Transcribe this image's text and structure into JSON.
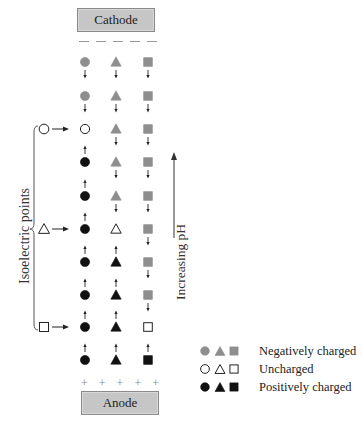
{
  "electrodes": {
    "cathode": "Cathode",
    "anode": "Anode",
    "cathode_sign": "−",
    "anode_sign": "+"
  },
  "labels": {
    "isoelectric": "Isoelectric points",
    "ph_axis": "Increasing pH"
  },
  "colors": {
    "negative": "#8e8e8e",
    "uncharged": "#ffffff",
    "positive": "#111111",
    "box": "#c6c6c6"
  },
  "columns": [
    "circle",
    "triangle",
    "square"
  ],
  "rows": [
    {
      "circle": {
        "state": "neg",
        "arrow": "down"
      },
      "triangle": {
        "state": "neg",
        "arrow": "down"
      },
      "square": {
        "state": "neg",
        "arrow": "down"
      }
    },
    {
      "circle": {
        "state": "neg",
        "arrow": "down"
      },
      "triangle": {
        "state": "neg",
        "arrow": "down"
      },
      "square": {
        "state": "neg",
        "arrow": "down"
      }
    },
    {
      "circle": {
        "state": "neutral",
        "arrow": "none"
      },
      "triangle": {
        "state": "neg",
        "arrow": "down"
      },
      "square": {
        "state": "neg",
        "arrow": "down"
      }
    },
    {
      "circle": {
        "state": "pos",
        "arrow": "up"
      },
      "triangle": {
        "state": "neg",
        "arrow": "down"
      },
      "square": {
        "state": "neg",
        "arrow": "down"
      }
    },
    {
      "circle": {
        "state": "pos",
        "arrow": "up"
      },
      "triangle": {
        "state": "neg",
        "arrow": "down"
      },
      "square": {
        "state": "neg",
        "arrow": "down"
      }
    },
    {
      "circle": {
        "state": "pos",
        "arrow": "up"
      },
      "triangle": {
        "state": "neutral",
        "arrow": "none"
      },
      "square": {
        "state": "neg",
        "arrow": "down"
      }
    },
    {
      "circle": {
        "state": "pos",
        "arrow": "up"
      },
      "triangle": {
        "state": "pos",
        "arrow": "up"
      },
      "square": {
        "state": "neg",
        "arrow": "down"
      }
    },
    {
      "circle": {
        "state": "pos",
        "arrow": "up"
      },
      "triangle": {
        "state": "pos",
        "arrow": "up"
      },
      "square": {
        "state": "neg",
        "arrow": "down"
      }
    },
    {
      "circle": {
        "state": "pos",
        "arrow": "up"
      },
      "triangle": {
        "state": "pos",
        "arrow": "up"
      },
      "square": {
        "state": "neutral",
        "arrow": "none"
      }
    },
    {
      "circle": {
        "state": "pos",
        "arrow": "up"
      },
      "triangle": {
        "state": "pos",
        "arrow": "up"
      },
      "square": {
        "state": "pos",
        "arrow": "up"
      }
    }
  ],
  "isoelectric_points": [
    {
      "shape": "circle",
      "row": 3
    },
    {
      "shape": "triangle",
      "row": 6
    },
    {
      "shape": "square",
      "row": 9
    }
  ],
  "legend": [
    {
      "state": "neg",
      "label": "Negatively charged"
    },
    {
      "state": "neutral",
      "label": "Uncharged"
    },
    {
      "state": "pos",
      "label": "Positively charged"
    }
  ]
}
